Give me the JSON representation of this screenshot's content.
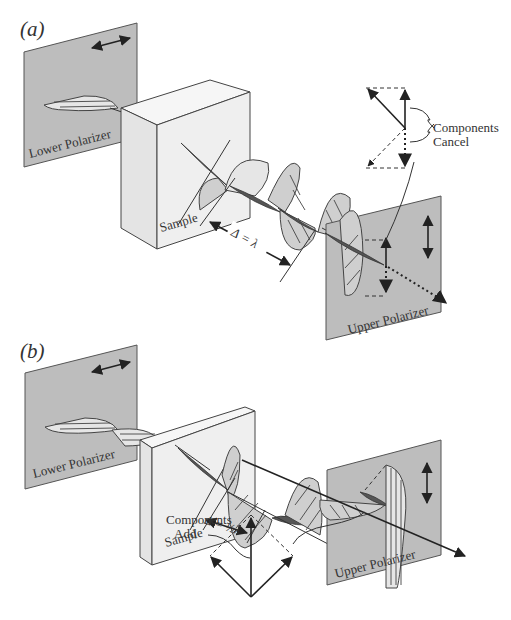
{
  "figure": {
    "panels": [
      {
        "id": "a",
        "label": "(a)",
        "lower_polarizer": {
          "label": "Lower Polarizer",
          "orientation": "horizontal"
        },
        "sample": {
          "label": "Sample"
        },
        "retardation_label": "Δ = λ",
        "upper_polarizer": {
          "label": "Upper Polarizer",
          "orientation": "vertical"
        },
        "vector_callout": {
          "label_line1": "Components",
          "label_line2": "Cancel"
        }
      },
      {
        "id": "b",
        "label": "(b)",
        "lower_polarizer": {
          "label": "Lower Polarizer",
          "orientation": "horizontal"
        },
        "sample": {
          "label": "Sample"
        },
        "retardation_label": "Δ = ½λ",
        "upper_polarizer": {
          "label": "Upper Polarizer",
          "orientation": "vertical"
        },
        "vector_callout": {
          "label_line1": "Components",
          "label_line2": "Add"
        }
      }
    ]
  },
  "colors": {
    "polarizer_fill": "#bdbdbd",
    "sample_fill": "#efefef",
    "wave_fill": "#cfcfcf",
    "line": "#333333"
  }
}
